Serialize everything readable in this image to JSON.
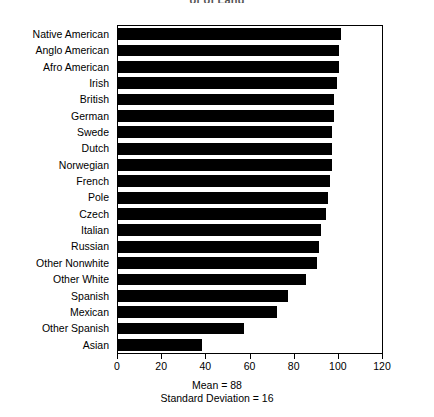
{
  "chart_data": {
    "type": "bar",
    "orientation": "horizontal",
    "title": "of of Land",
    "xlabel": "",
    "ylabel": "",
    "xlim": [
      0,
      120
    ],
    "xticks": [
      0,
      20,
      40,
      60,
      80,
      100,
      120
    ],
    "xtick_labels": [
      "0",
      "20",
      "40",
      "60",
      "80",
      "100",
      "120"
    ],
    "grid": false,
    "legend": false,
    "categories": [
      "Native American",
      "Anglo American",
      "Afro American",
      "Irish",
      "British",
      "German",
      "Swede",
      "Dutch",
      "Norwegian",
      "French",
      "Pole",
      "Czech",
      "Italian",
      "Russian",
      "Other Nonwhite",
      "Other White",
      "Spanish",
      "Mexican",
      "Other Spanish",
      "Asian"
    ],
    "values": [
      101,
      100,
      100,
      99,
      98,
      98,
      97,
      97,
      97,
      96,
      95,
      94,
      92,
      91,
      90,
      85,
      77,
      72,
      57,
      38
    ],
    "annotations": [
      "Mean = 88",
      "Standard Deviation = 16"
    ],
    "bar_color": "#000000",
    "frame_color": "#000000",
    "background_color": "#ffffff"
  },
  "footer": {
    "mean_label": "Mean = 88",
    "sd_label": "Standard Deviation = 16"
  }
}
